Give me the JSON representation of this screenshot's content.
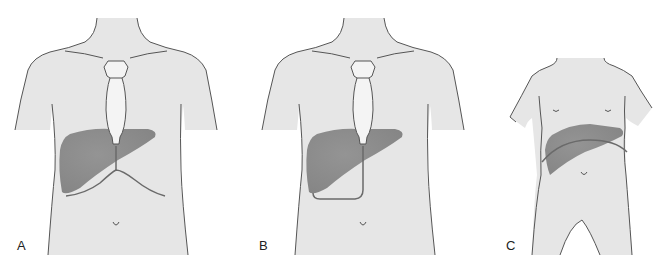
{
  "figure": {
    "panels": [
      {
        "id": "A",
        "label": "A",
        "subject": "adult torso",
        "liver_span_line": "midline vertical line with curved lower costal margin"
      },
      {
        "id": "B",
        "label": "B",
        "subject": "adult torso",
        "liver_span_line": "midline line looping below right lobe"
      },
      {
        "id": "C",
        "label": "C",
        "subject": "child torso",
        "liver_span_line": "arc across liver"
      }
    ]
  },
  "colors": {
    "skin": "#e6e6e6",
    "outline": "#555555",
    "liver": "#8c8c8c",
    "liver_line": "#6a6a6a",
    "sternum": "#f4f4f4",
    "background": "#ffffff"
  }
}
